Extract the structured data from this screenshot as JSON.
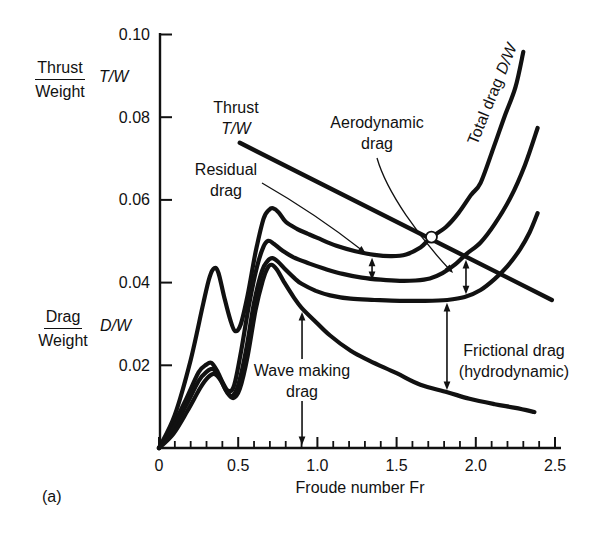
{
  "labels": {
    "y_axis_upper": {
      "numerator": "Thrust",
      "denominator": "Weight",
      "symbol": "T/W"
    },
    "y_axis_lower": {
      "numerator": "Drag",
      "denominator": "Weight",
      "symbol": "D/W"
    },
    "thrust_curve": {
      "line1": "Thrust",
      "line2": "T/W"
    },
    "residual": {
      "line1": "Residual",
      "line2": "drag"
    },
    "aerodynamic": {
      "line1": "Aerodynamic",
      "line2": "drag"
    },
    "total_drag_text": "Total drag",
    "total_drag_symbol": "D/W",
    "frictional": {
      "line1": "Frictional drag",
      "line2": "(hydrodynamic)"
    },
    "wave_making": {
      "line1": "Wave making",
      "line2": "drag"
    },
    "x_axis_title": "Froude number Fr",
    "panel": "(a)"
  },
  "chart_data": {
    "type": "line",
    "title": "",
    "xlabel": "Froude number Fr",
    "ylabel_upper": "Thrust/Weight T/W",
    "ylabel_lower": "Drag/Weight D/W",
    "xlim": [
      0,
      2.5
    ],
    "ylim": [
      0,
      0.1
    ],
    "grid": false,
    "x_ticks": [
      0,
      0.5,
      1.0,
      1.5,
      2.0,
      2.5
    ],
    "x_tick_labels": [
      "0",
      "0.5",
      "1.0",
      "1.5",
      "2.0",
      "2.5"
    ],
    "x_minor_step": 0.1,
    "y_ticks": [
      0.02,
      0.04,
      0.06,
      0.08,
      0.1
    ],
    "y_tick_labels": [
      "0.02",
      "0.04",
      "0.06",
      "0.08",
      "0.10"
    ],
    "design_point": {
      "x": 1.72,
      "y": 0.051
    },
    "series": [
      {
        "key": "thrust-line",
        "width": 4.4,
        "points": [
          [
            0.51,
            0.0738
          ],
          [
            2.48,
            0.0358
          ]
        ]
      },
      {
        "key": "total-drag",
        "width": 4.2,
        "points": [
          [
            0,
            0
          ],
          [
            0.1,
            0.008
          ],
          [
            0.2,
            0.0213
          ],
          [
            0.28,
            0.0351
          ],
          [
            0.32,
            0.0414
          ],
          [
            0.35,
            0.0435
          ],
          [
            0.375,
            0.0424
          ],
          [
            0.41,
            0.0368
          ],
          [
            0.45,
            0.031
          ],
          [
            0.48,
            0.0283
          ],
          [
            0.515,
            0.0298
          ],
          [
            0.56,
            0.037
          ],
          [
            0.61,
            0.0474
          ],
          [
            0.66,
            0.0554
          ],
          [
            0.695,
            0.0576
          ],
          [
            0.72,
            0.058
          ],
          [
            0.755,
            0.057
          ],
          [
            0.8,
            0.0547
          ],
          [
            0.87,
            0.053
          ],
          [
            0.94,
            0.0518
          ],
          [
            1.0,
            0.0508
          ],
          [
            1.12,
            0.0489
          ],
          [
            1.24,
            0.0476
          ],
          [
            1.36,
            0.0467
          ],
          [
            1.47,
            0.0464
          ],
          [
            1.56,
            0.0468
          ],
          [
            1.65,
            0.0485
          ],
          [
            1.72,
            0.051
          ],
          [
            1.81,
            0.0534
          ],
          [
            1.89,
            0.0568
          ],
          [
            1.97,
            0.0612
          ],
          [
            2.03,
            0.0641
          ],
          [
            2.11,
            0.0724
          ],
          [
            2.18,
            0.08
          ],
          [
            2.25,
            0.0872
          ],
          [
            2.3,
            0.0958
          ]
        ]
      },
      {
        "key": "drag-less-residual",
        "width": 4.2,
        "points": [
          [
            0,
            0
          ],
          [
            0.08,
            0.0048
          ],
          [
            0.17,
            0.0117
          ],
          [
            0.25,
            0.0183
          ],
          [
            0.3,
            0.0202
          ],
          [
            0.33,
            0.0206
          ],
          [
            0.365,
            0.0188
          ],
          [
            0.405,
            0.0156
          ],
          [
            0.44,
            0.0138
          ],
          [
            0.475,
            0.0152
          ],
          [
            0.52,
            0.0238
          ],
          [
            0.57,
            0.035
          ],
          [
            0.62,
            0.044
          ],
          [
            0.66,
            0.0487
          ],
          [
            0.69,
            0.0501
          ],
          [
            0.725,
            0.0494
          ],
          [
            0.78,
            0.0477
          ],
          [
            0.85,
            0.0461
          ],
          [
            0.95,
            0.0446
          ],
          [
            1.05,
            0.0433
          ],
          [
            1.16,
            0.0421
          ],
          [
            1.28,
            0.0412
          ],
          [
            1.4,
            0.0407
          ],
          [
            1.52,
            0.0404
          ],
          [
            1.62,
            0.0405
          ],
          [
            1.71,
            0.041
          ],
          [
            1.79,
            0.0423
          ],
          [
            1.87,
            0.0444
          ],
          [
            1.94,
            0.0469
          ],
          [
            2.03,
            0.0497
          ],
          [
            2.12,
            0.0542
          ],
          [
            2.22,
            0.0606
          ],
          [
            2.31,
            0.0684
          ],
          [
            2.39,
            0.0774
          ]
        ]
      },
      {
        "key": "friction-plus-wave",
        "width": 4.2,
        "points": [
          [
            0,
            0
          ],
          [
            0.08,
            0.0041
          ],
          [
            0.17,
            0.0102
          ],
          [
            0.25,
            0.0162
          ],
          [
            0.3,
            0.0184
          ],
          [
            0.34,
            0.0191
          ],
          [
            0.38,
            0.0173
          ],
          [
            0.42,
            0.0142
          ],
          [
            0.46,
            0.0126
          ],
          [
            0.5,
            0.0152
          ],
          [
            0.55,
            0.0237
          ],
          [
            0.6,
            0.0351
          ],
          [
            0.65,
            0.0428
          ],
          [
            0.685,
            0.0452
          ],
          [
            0.715,
            0.0459
          ],
          [
            0.75,
            0.0451
          ],
          [
            0.8,
            0.0431
          ],
          [
            0.86,
            0.0409
          ],
          [
            0.9,
            0.0397
          ],
          [
            0.99,
            0.038
          ],
          [
            1.08,
            0.0369
          ],
          [
            1.21,
            0.0361
          ],
          [
            1.36,
            0.0358
          ],
          [
            1.52,
            0.0356
          ],
          [
            1.68,
            0.0356
          ],
          [
            1.82,
            0.0358
          ],
          [
            1.93,
            0.0365
          ],
          [
            2.03,
            0.0382
          ],
          [
            2.12,
            0.0409
          ],
          [
            2.2,
            0.044
          ],
          [
            2.28,
            0.0481
          ],
          [
            2.34,
            0.0522
          ],
          [
            2.39,
            0.0568
          ]
        ]
      },
      {
        "key": "wave-making",
        "width": 4.2,
        "points": [
          [
            0,
            0
          ],
          [
            0.09,
            0.0034
          ],
          [
            0.18,
            0.009
          ],
          [
            0.26,
            0.0145
          ],
          [
            0.31,
            0.0171
          ],
          [
            0.35,
            0.0179
          ],
          [
            0.39,
            0.0163
          ],
          [
            0.43,
            0.0134
          ],
          [
            0.47,
            0.0121
          ],
          [
            0.51,
            0.0143
          ],
          [
            0.56,
            0.0223
          ],
          [
            0.61,
            0.0334
          ],
          [
            0.655,
            0.0405
          ],
          [
            0.685,
            0.0435
          ],
          [
            0.71,
            0.0443
          ],
          [
            0.745,
            0.0431
          ],
          [
            0.79,
            0.0401
          ],
          [
            0.85,
            0.0365
          ],
          [
            0.9,
            0.0339
          ],
          [
            0.99,
            0.0305
          ],
          [
            1.08,
            0.0272
          ],
          [
            1.21,
            0.0235
          ],
          [
            1.33,
            0.0211
          ],
          [
            1.5,
            0.0181
          ],
          [
            1.65,
            0.0153
          ],
          [
            1.82,
            0.0135
          ],
          [
            1.96,
            0.0119
          ],
          [
            2.12,
            0.0106
          ],
          [
            2.25,
            0.0097
          ],
          [
            2.37,
            0.0087
          ]
        ]
      }
    ],
    "gap_arrows": [
      {
        "name": "residual-drag-gap-arrow",
        "x": 1.345,
        "y_top": 0.046,
        "y_bottom": 0.0406
      },
      {
        "name": "aerodynamic-drag-gap-arrow",
        "x": 1.938,
        "y_top": 0.0455,
        "y_bottom": 0.0372
      },
      {
        "name": "frictional-drag-gap-arrow",
        "x": 1.818,
        "y_top": 0.0351,
        "y_bottom": 0.014
      },
      {
        "name": "wave-making-drag-gap-arrow",
        "x": 0.903,
        "y_top": 0.0329,
        "y_bottom": 0.0007,
        "label_gap": true
      }
    ]
  }
}
